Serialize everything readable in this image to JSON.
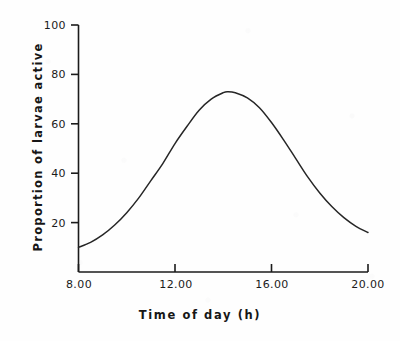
{
  "figure": {
    "background_color": "#fdfdfd",
    "ink_color": "#1b1b1b"
  },
  "chart_data": {
    "type": "line",
    "title": "",
    "xlabel": "Time of day (h)",
    "ylabel": "Proportion of larvae active",
    "xlim": [
      8,
      20
    ],
    "ylim": [
      0,
      100
    ],
    "grid": false,
    "legend": false,
    "x_tick_labels": [
      "8.00",
      "12.00",
      "16.00",
      "20.00"
    ],
    "x_tick_values": [
      8,
      12,
      16,
      20
    ],
    "y_tick_labels": [
      "20",
      "40",
      "60",
      "80",
      "100"
    ],
    "y_tick_values": [
      20,
      40,
      60,
      80,
      100
    ],
    "series": [
      {
        "name": "Proportion of larvae active",
        "color": "#262626",
        "x": [
          8.0,
          8.5,
          9.0,
          9.5,
          10.0,
          10.5,
          11.0,
          11.5,
          12.0,
          12.5,
          13.0,
          13.5,
          14.0,
          14.2,
          14.5,
          15.0,
          15.5,
          16.0,
          16.5,
          17.0,
          17.5,
          18.0,
          18.5,
          19.0,
          19.5,
          20.0
        ],
        "y": [
          10.0,
          12.0,
          15.0,
          19.0,
          24.0,
          30.0,
          37.0,
          44.0,
          52.0,
          59.0,
          65.5,
          70.0,
          72.6,
          73.0,
          72.6,
          70.5,
          66.5,
          60.5,
          53.5,
          46.0,
          38.5,
          32.0,
          26.5,
          22.0,
          18.5,
          16.0
        ]
      }
    ],
    "peak": {
      "x": 14.2,
      "y": 73.0
    },
    "start_point": {
      "x": 8.0,
      "y": 10.0
    },
    "end_point": {
      "x": 20.0,
      "y": 16.0
    }
  }
}
